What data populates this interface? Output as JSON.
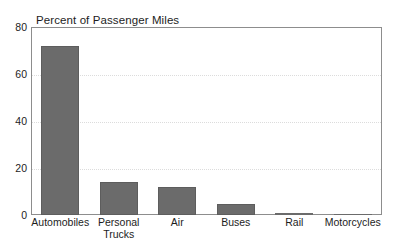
{
  "chart_data": {
    "type": "bar",
    "title": "Percent of Passenger Miles",
    "xlabel": "",
    "ylabel": "",
    "categories": [
      "Automobiles",
      "Personal\nTrucks",
      "Air",
      "Buses",
      "Rail",
      "Motorcycles"
    ],
    "values": [
      72,
      14,
      12,
      4.5,
      1,
      0.2
    ],
    "ylim": [
      0,
      80
    ],
    "yticks": [
      0,
      20,
      40,
      60,
      80
    ],
    "ytick_labels": [
      "0",
      "20",
      "40",
      "60",
      "80"
    ],
    "grid": true,
    "grid_axis": "y",
    "legend": false,
    "colors": {
      "bar_fill": "#6b6b6b",
      "bar_edge": "#5d5d5d",
      "frame": "#8d8d8d",
      "grid": "#dcdcdc",
      "text": "#1d1d1d",
      "background": "#ffffff"
    }
  }
}
